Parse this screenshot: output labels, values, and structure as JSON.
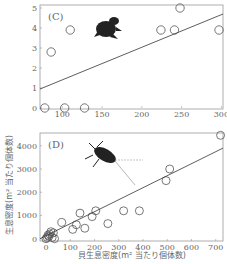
{
  "chart_data": [
    {
      "type": "scatter",
      "panel_label": "(C)",
      "xlabel": "",
      "ylabel": "",
      "xlim": [
        72,
        302
      ],
      "ylim": [
        0,
        5
      ],
      "xticks": [
        100,
        150,
        200,
        250,
        300
      ],
      "yticks": [
        0,
        1,
        2,
        3,
        4,
        5
      ],
      "grid": false,
      "points": [
        {
          "x": 78,
          "y": 0
        },
        {
          "x": 103,
          "y": 0
        },
        {
          "x": 128,
          "y": 0
        },
        {
          "x": 86,
          "y": 2.8
        },
        {
          "x": 110,
          "y": 3.9
        },
        {
          "x": 224,
          "y": 3.9
        },
        {
          "x": 241,
          "y": 3.9
        },
        {
          "x": 248,
          "y": 5
        },
        {
          "x": 297,
          "y": 3.9
        }
      ],
      "regression_line": {
        "x0": 72,
        "y0": 0.95,
        "x1": 302,
        "y1": 4.7
      },
      "illustration": "frog-silhouette"
    },
    {
      "type": "scatter",
      "panel_label": "(D)",
      "xlabel": "貝生息密度(m² 当たり個体数)",
      "ylabel": "生息密度(m² 当たり個体数)",
      "xlim": [
        -25,
        730
      ],
      "ylim": [
        -100,
        4550
      ],
      "xticks": [
        0,
        100,
        200,
        300,
        400,
        500,
        600,
        700
      ],
      "yticks": [
        0,
        1000,
        2000,
        3000,
        4000
      ],
      "grid": false,
      "points": [
        {
          "x": 0,
          "y": 0
        },
        {
          "x": 5,
          "y": 50
        },
        {
          "x": 8,
          "y": 150
        },
        {
          "x": 12,
          "y": 100
        },
        {
          "x": 15,
          "y": 200
        },
        {
          "x": 20,
          "y": 300
        },
        {
          "x": 25,
          "y": 50
        },
        {
          "x": 30,
          "y": 250
        },
        {
          "x": 35,
          "y": 0
        },
        {
          "x": 65,
          "y": 700
        },
        {
          "x": 110,
          "y": 400
        },
        {
          "x": 125,
          "y": 600
        },
        {
          "x": 140,
          "y": 1100
        },
        {
          "x": 160,
          "y": 450
        },
        {
          "x": 190,
          "y": 950
        },
        {
          "x": 205,
          "y": 1200
        },
        {
          "x": 255,
          "y": 650
        },
        {
          "x": 320,
          "y": 1200
        },
        {
          "x": 385,
          "y": 1200
        },
        {
          "x": 495,
          "y": 2500
        },
        {
          "x": 510,
          "y": 3000
        },
        {
          "x": 720,
          "y": 4450
        }
      ],
      "regression_line": {
        "x0": -25,
        "y0": 0,
        "x1": 730,
        "y1": 3900
      },
      "illustration": "water-bug-silhouette"
    }
  ]
}
